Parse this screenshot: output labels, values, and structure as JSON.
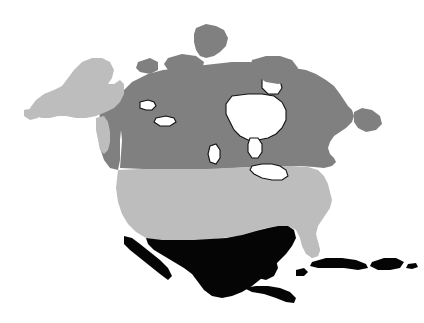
{
  "figure": {
    "width": 424,
    "height": 323,
    "background_color": "#ffffff",
    "projection_note": "North America political map, grayscale choropleth"
  },
  "palette": {
    "canada_gray": "#808080",
    "usa_gray": "#bdbdbd",
    "mexico_black": "#050505",
    "water_white": "#ffffff",
    "outline_black": "#141414",
    "background": "#ffffff"
  },
  "legend_classes": [
    {
      "key": "dark-gray",
      "color": "#808080",
      "label": "Canada"
    },
    {
      "key": "light-gray",
      "color": "#bdbdbd",
      "label": "United States"
    },
    {
      "key": "black",
      "color": "#050505",
      "label": "Mexico, Central America and Caribbean"
    },
    {
      "key": "white",
      "color": "#ffffff",
      "label": "Water"
    }
  ],
  "regions": [
    {
      "name": "canada-mainland",
      "label": "Canada",
      "fill_key": "canada_gray",
      "path": "M 120 168 L 122 140 L 120 120 L 118 104 L 122 92 L 132 82 L 148 74 L 163 70 L 180 68 L 196 66 L 214 64 L 232 62 L 250 62 L 266 64 L 280 66 L 294 68 L 306 70 L 316 74 L 326 80 L 334 86 L 340 94 L 344 100 L 348 106 L 352 110 L 354 116 L 352 122 L 346 128 L 340 132 L 334 136 L 330 142 L 328 148 L 330 154 L 334 158 L 336 162 L 332 166 L 324 168 L 314 167 L 300 166 L 286 166 L 270 166 L 252 167 L 234 168 L 216 169 L 198 169 L 180 169 L 162 169 L 144 169 Z"
    },
    {
      "name": "canada-west-coast",
      "label": "British Columbia coast",
      "fill_key": "canada_gray",
      "path": "M 100 112 L 108 104 L 116 100 L 122 104 L 122 120 L 120 140 L 120 160 L 118 170 L 110 168 L 104 160 L 100 148 L 98 132 Z"
    },
    {
      "name": "hudson-bay",
      "label": "Hudson Bay",
      "fill_key": "water_white",
      "path": "M 232 96 L 248 94 L 262 94 L 274 96 L 282 102 L 286 110 L 286 120 L 282 128 L 276 134 L 268 138 L 258 140 L 248 140 L 240 136 L 234 130 L 230 122 L 226 114 L 226 104 Z"
    },
    {
      "name": "james-bay",
      "label": "James Bay",
      "fill_key": "water_white",
      "path": "M 250 138 L 258 138 L 262 144 L 262 152 L 258 158 L 252 158 L 248 152 L 248 144 Z"
    },
    {
      "name": "foxe-basin",
      "label": "Foxe Basin",
      "fill_key": "water_white",
      "path": "M 262 78 L 272 76 L 280 80 L 282 88 L 278 94 L 268 94 L 262 88 Z"
    },
    {
      "name": "arctic-island-ellesmere",
      "label": "Ellesmere Island",
      "fill_key": "canada_gray",
      "path": "M 196 28 L 206 24 L 216 26 L 224 30 L 228 38 L 226 46 L 220 52 L 214 56 L 206 58 L 200 56 L 196 50 L 194 42 L 194 34 Z"
    },
    {
      "name": "arctic-island-baffin",
      "label": "Baffin Island",
      "fill_key": "canada_gray",
      "path": "M 252 60 L 266 56 L 280 56 L 292 60 L 298 68 L 296 76 L 288 82 L 278 84 L 266 82 L 256 76 L 250 68 Z"
    },
    {
      "name": "arctic-island-victoria",
      "label": "Victoria Island",
      "fill_key": "canada_gray",
      "path": "M 168 58 L 182 54 L 196 56 L 204 62 L 202 70 L 192 74 L 178 74 L 168 70 L 164 64 Z"
    },
    {
      "name": "arctic-island-banks",
      "label": "Banks Island",
      "fill_key": "canada_gray",
      "path": "M 138 62 L 150 58 L 158 62 L 158 70 L 150 74 L 140 72 L 136 68 Z"
    },
    {
      "name": "newfoundland-island",
      "label": "Newfoundland",
      "fill_key": "canada_gray",
      "path": "M 354 112 L 362 108 L 372 110 L 380 116 L 382 124 L 376 130 L 366 132 L 358 128 L 354 122 Z"
    },
    {
      "name": "united-states-mainland",
      "label": "United States",
      "fill_key": "usa_gray",
      "path": "M 118 170 L 140 169 L 162 169 L 184 169 L 206 169 L 228 168 L 250 167 L 272 166 L 292 166 L 308 167 L 318 170 L 324 176 L 328 184 L 330 192 L 332 200 L 330 208 L 326 214 L 322 220 L 318 226 L 316 234 L 318 242 L 320 250 L 318 256 L 312 258 L 306 254 L 302 246 L 300 238 L 296 230 L 288 226 L 278 226 L 266 228 L 252 232 L 238 236 L 222 238 L 206 240 L 190 240 L 174 240 L 158 240 L 146 238 L 136 232 L 128 224 L 122 214 L 118 202 L 116 188 Z"
    },
    {
      "name": "alaska",
      "label": "Alaska",
      "fill_key": "usa_gray",
      "path": "M 30 108 L 36 100 L 44 94 L 54 90 L 62 86 L 68 78 L 74 70 L 82 62 L 92 58 L 102 58 L 110 62 L 114 70 L 112 78 L 108 84 L 114 84 L 120 80 L 124 84 L 124 94 L 120 102 L 114 108 L 106 112 L 96 116 L 86 118 L 76 118 L 66 116 L 58 116 L 50 118 L 42 118 L 34 116 Z"
    },
    {
      "name": "alaska-panhandle",
      "label": "Alaska panhandle",
      "fill_key": "usa_gray",
      "path": "M 96 118 L 104 116 L 108 122 L 110 132 L 110 142 L 108 150 L 104 154 L 100 150 L 98 140 L 96 130 Z"
    },
    {
      "name": "aleutian-tip",
      "label": "Alaska southwest tip",
      "fill_key": "usa_gray",
      "path": "M 24 110 L 34 108 L 40 112 L 38 118 L 30 120 L 24 116 Z"
    },
    {
      "name": "florida-peninsula",
      "label": "Florida",
      "fill_key": "usa_gray",
      "path": "M 300 226 L 308 228 L 314 234 L 318 242 L 320 250 L 318 256 L 312 258 L 306 252 L 302 244 L 300 236 Z"
    },
    {
      "name": "great-lakes",
      "label": "Great Lakes",
      "fill_key": "water_white",
      "path": "M 252 166 L 262 164 L 272 164 L 280 166 L 286 170 L 288 176 L 282 180 L 272 180 L 262 178 L 254 174 L 250 170 Z"
    },
    {
      "name": "great-bear-lake",
      "label": "Great Bear Lake",
      "fill_key": "water_white",
      "path": "M 140 102 L 148 100 L 154 102 L 156 106 L 152 110 L 146 110 L 140 108 Z"
    },
    {
      "name": "great-slave-lake",
      "label": "Great Slave Lake",
      "fill_key": "water_white",
      "path": "M 156 118 L 166 116 L 174 118 L 176 122 L 170 126 L 160 126 L 154 122 Z"
    },
    {
      "name": "lake-winnipeg",
      "label": "Lake Winnipeg",
      "fill_key": "water_white",
      "path": "M 210 146 L 216 144 L 220 150 L 220 158 L 216 164 L 210 162 L 208 154 Z"
    },
    {
      "name": "mexico-mainland",
      "label": "Mexico",
      "fill_key": "mexico_black",
      "path": "M 146 238 L 162 240 L 178 240 L 194 240 L 210 239 L 226 238 L 242 235 L 256 231 L 268 228 L 278 226 L 288 226 L 294 230 L 296 238 L 292 246 L 286 254 L 278 262 L 270 270 L 262 278 L 252 286 L 242 292 L 232 296 L 222 298 L 212 296 L 204 290 L 198 282 L 192 274 L 184 268 L 174 262 L 164 256 L 154 250 L 148 244 Z"
    },
    {
      "name": "baja-california",
      "label": "Baja California",
      "fill_key": "mexico_black",
      "path": "M 124 236 L 132 238 L 140 244 L 150 252 L 160 260 L 168 268 L 172 276 L 168 280 L 160 274 L 150 266 L 140 258 L 130 250 L 124 244 Z"
    },
    {
      "name": "yucatan-peninsula",
      "label": "Yucatan Peninsula",
      "fill_key": "mexico_black",
      "path": "M 256 258 L 268 256 L 276 260 L 278 268 L 274 276 L 266 280 L 258 278 L 254 270 L 254 262 Z"
    },
    {
      "name": "central-america",
      "label": "Central America",
      "fill_key": "mexico_black",
      "path": "M 244 288 L 256 286 L 268 286 L 280 288 L 290 292 L 296 298 L 294 303 L 286 302 L 276 298 L 264 294 L 252 292 Z"
    },
    {
      "name": "cuba",
      "label": "Cuba",
      "fill_key": "mexico_black",
      "path": "M 312 262 L 326 258 L 342 258 L 356 260 L 366 264 L 368 268 L 358 270 L 344 268 L 330 268 L 318 268 L 310 266 Z"
    },
    {
      "name": "hispaniola",
      "label": "Hispaniola",
      "fill_key": "mexico_black",
      "path": "M 372 262 L 384 258 L 396 258 L 404 262 L 400 268 L 390 270 L 378 270 L 370 266 Z"
    },
    {
      "name": "jamaica",
      "label": "Jamaica",
      "fill_key": "mexico_black",
      "path": "M 296 270 L 304 268 L 308 272 L 304 276 L 296 276 Z"
    },
    {
      "name": "puerto-rico",
      "label": "Puerto Rico",
      "fill_key": "mexico_black",
      "path": "M 408 264 L 416 263 L 418 267 L 412 269 L 406 268 Z"
    }
  ]
}
